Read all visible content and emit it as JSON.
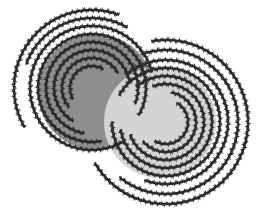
{
  "illustration": {
    "description": "Two overlapping shaded discs with wavy concentric arc rings",
    "background": "#ffffff",
    "stroke_color": "#2a2a2a",
    "discs": [
      {
        "name": "dark-disc",
        "cx": 96,
        "cy": 92,
        "r": 58,
        "fill": "#8e8e8e"
      },
      {
        "name": "light-disc",
        "cx": 160,
        "cy": 122,
        "r": 56,
        "fill": "#d4d4d4"
      }
    ],
    "ring_sets": [
      {
        "name": "left-rings",
        "cx": 92,
        "cy": 88,
        "arcs": [
          {
            "r": 22,
            "start": 150,
            "end": 300
          },
          {
            "r": 30,
            "start": 140,
            "end": 330
          },
          {
            "r": 38,
            "start": 120,
            "end": 350
          },
          {
            "r": 46,
            "start": 100,
            "end": 20
          },
          {
            "r": 54,
            "start": 80,
            "end": 30
          },
          {
            "r": 62,
            "start": 60,
            "end": 345
          },
          {
            "r": 70,
            "start": 200,
            "end": 300
          },
          {
            "r": 78,
            "start": 150,
            "end": 290
          }
        ]
      },
      {
        "name": "right-rings",
        "cx": 166,
        "cy": 122,
        "arcs": [
          {
            "r": 22,
            "start": 300,
            "end": 120
          },
          {
            "r": 30,
            "start": 280,
            "end": 140
          },
          {
            "r": 38,
            "start": 250,
            "end": 160
          },
          {
            "r": 46,
            "start": 230,
            "end": 170
          },
          {
            "r": 54,
            "start": 210,
            "end": 180
          },
          {
            "r": 62,
            "start": 230,
            "end": 110
          },
          {
            "r": 72,
            "start": 250,
            "end": 130
          },
          {
            "r": 82,
            "start": 260,
            "end": 150
          }
        ]
      }
    ]
  }
}
